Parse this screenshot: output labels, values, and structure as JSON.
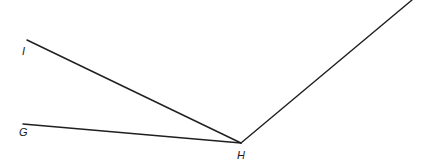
{
  "figure": {
    "type": "geometry-angle-diagram",
    "background_color": "#ffffff",
    "stroke_color": "#1f1f1f",
    "stroke_width": 1.4,
    "width": 429,
    "height": 168,
    "labels": {
      "i": "I",
      "g": "G",
      "h": "H"
    },
    "points": {
      "I": {
        "x": 27,
        "y": 40
      },
      "G": {
        "x": 23,
        "y": 124
      },
      "H": {
        "x": 241,
        "y": 143
      },
      "ray_end": {
        "x": 412,
        "y": 0
      }
    },
    "segments": [
      {
        "name": "segment-IH",
        "from": "I",
        "to": "H"
      },
      {
        "name": "segment-GH",
        "from": "G",
        "to": "H"
      },
      {
        "name": "ray-H-upright",
        "from": "H",
        "to": "ray_end"
      }
    ]
  }
}
